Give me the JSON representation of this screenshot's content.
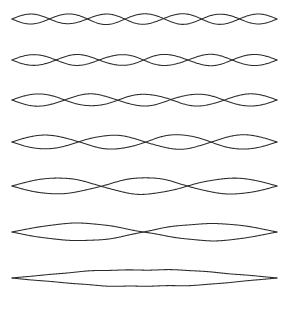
{
  "figure": {
    "background_color": "#ffffff",
    "stroke_color": "#2b2b2b",
    "caption": "",
    "string_left_x": 12,
    "string_right_x": 277
  },
  "chart_data": {
    "type": "line",
    "subtitle": "",
    "xlabel": "",
    "ylabel": "",
    "xlim": [
      0,
      1
    ],
    "ylim": [
      -1,
      1
    ],
    "grid": false,
    "legend": "none",
    "annotations": [],
    "x_tick_labels": [],
    "y_tick_labels": [],
    "series": [
      {
        "name": "7th harmonic",
        "harmonic": 7,
        "loops": 7,
        "nodes": 8,
        "antinodes": 7,
        "row_index": 0,
        "center_y": 19,
        "amplitude_px": 5.0,
        "wavelength_fraction": 0.2857
      },
      {
        "name": "6th harmonic",
        "harmonic": 6,
        "loops": 6,
        "nodes": 7,
        "antinodes": 6,
        "row_index": 1,
        "center_y": 60,
        "amplitude_px": 5.5,
        "wavelength_fraction": 0.3333
      },
      {
        "name": "5th harmonic",
        "harmonic": 5,
        "loops": 5,
        "nodes": 6,
        "antinodes": 5,
        "row_index": 2,
        "center_y": 100,
        "amplitude_px": 6.2,
        "wavelength_fraction": 0.4
      },
      {
        "name": "4th harmonic",
        "harmonic": 4,
        "loops": 4,
        "nodes": 5,
        "antinodes": 4,
        "row_index": 3,
        "center_y": 142,
        "amplitude_px": 7.0,
        "wavelength_fraction": 0.5
      },
      {
        "name": "3rd harmonic",
        "harmonic": 3,
        "loops": 3,
        "nodes": 4,
        "antinodes": 3,
        "row_index": 4,
        "center_y": 186,
        "amplitude_px": 8.0,
        "wavelength_fraction": 0.6667
      },
      {
        "name": "2nd harmonic",
        "harmonic": 2,
        "loops": 2,
        "nodes": 3,
        "antinodes": 2,
        "row_index": 5,
        "center_y": 232,
        "amplitude_px": 8.6,
        "wavelength_fraction": 1.0
      },
      {
        "name": "1st harmonic (fundamental)",
        "harmonic": 1,
        "loops": 1,
        "nodes": 2,
        "antinodes": 1,
        "row_index": 6,
        "center_y": 278,
        "amplitude_px": 8.4,
        "wavelength_fraction": 2.0
      }
    ]
  }
}
